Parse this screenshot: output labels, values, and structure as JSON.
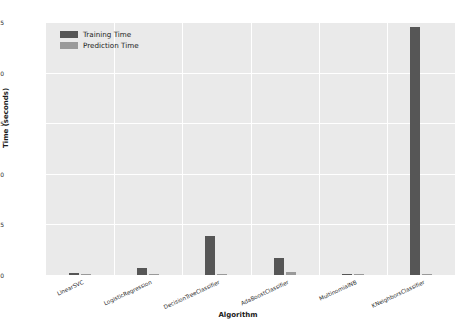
{
  "chart_data": {
    "type": "bar",
    "title": "",
    "xlabel": "Algorithm",
    "ylabel": "Time (seconds)",
    "ylim": [
      0,
      25
    ],
    "yticks": [
      0,
      5,
      10,
      15,
      20,
      25
    ],
    "grid": true,
    "legend_position": "upper left",
    "categories": [
      "LinearSVC",
      "LogisticRegression",
      "DecisionTreeClassifier",
      "AdaBoostClassifier",
      "MultinomialNB",
      "KNeighborsClassifier"
    ],
    "series": [
      {
        "name": "Training Time",
        "color": "#565656",
        "values": [
          0.15,
          0.72,
          3.9,
          1.7,
          0.05,
          24.5
        ]
      },
      {
        "name": "Prediction Time",
        "color": "#9a9a9a",
        "values": [
          0.02,
          0.03,
          0.03,
          0.25,
          0.02,
          0.1
        ]
      }
    ]
  },
  "axes": {
    "background_color": "#eaeaea",
    "grid_color": "#ffffff",
    "tick_text_color": "#2b2b2b",
    "label_text_color": "#1a1a1a"
  }
}
